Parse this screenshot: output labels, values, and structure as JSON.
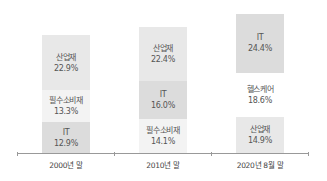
{
  "chart_data": {
    "type": "bar",
    "stacked": true,
    "title": "",
    "xlabel": "",
    "ylabel": "",
    "categories": [
      "2000년 말",
      "2010년 말",
      "2020년 8월 말"
    ],
    "stacks": [
      {
        "category": "2000년 말",
        "segments_bottom_to_top": [
          {
            "name": "IT",
            "value": 12.9,
            "label": "12.9%",
            "color": "#dcdcdc"
          },
          {
            "name": "필수소비재",
            "value": 13.3,
            "label": "13.3%",
            "color": "#f3f3f3"
          },
          {
            "name": "산업재",
            "value": 22.9,
            "label": "22.9%",
            "color": "#e8e8e8"
          }
        ]
      },
      {
        "category": "2010년 말",
        "segments_bottom_to_top": [
          {
            "name": "필수소비재",
            "value": 14.1,
            "label": "14.1%",
            "color": "#f3f3f3"
          },
          {
            "name": "IT",
            "value": 16.0,
            "label": "16.0%",
            "color": "#dcdcdc"
          },
          {
            "name": "산업재",
            "value": 22.4,
            "label": "22.4%",
            "color": "#e8e8e8"
          }
        ]
      },
      {
        "category": "2020년 8월 말",
        "segments_bottom_to_top": [
          {
            "name": "산업재",
            "value": 14.9,
            "label": "14.9%",
            "color": "#e8e8e8"
          },
          {
            "name": "헬스케어",
            "value": 18.6,
            "label": "18.6%",
            "color": "#ffffff"
          },
          {
            "name": "IT",
            "value": 24.4,
            "label": "24.4%",
            "color": "#dcdcdc"
          }
        ]
      }
    ],
    "legend": null,
    "grid": false
  }
}
